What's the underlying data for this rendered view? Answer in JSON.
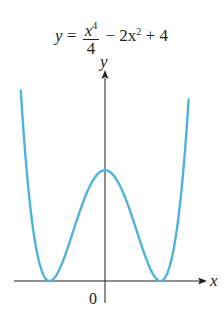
{
  "chart_data": {
    "type": "line",
    "title_parts": {
      "lhs": "y",
      "eq": "=",
      "num_base": "x",
      "num_exp": "4",
      "den": "4",
      "rest": "− 2x",
      "rest_exp": "2",
      "tail": "+ 4"
    },
    "xlabel": "x",
    "ylabel": "y",
    "origin_label": "0",
    "series": [
      {
        "name": "y = x^4/4 - 2x^2 + 4",
        "color": "#4fb3dc",
        "x": [
          -3,
          -2.5,
          -2,
          -1.5,
          -1,
          -0.5,
          0,
          0.5,
          1,
          1.5,
          2,
          2.5,
          3
        ],
        "values": [
          6.25,
          1.27,
          0,
          0.77,
          2.25,
          3.52,
          4,
          3.52,
          2.25,
          0.77,
          0,
          1.27,
          6.25
        ]
      }
    ],
    "xlim": [
      -3.7,
      4.2
    ],
    "ylim": [
      -0.8,
      6.6
    ],
    "grid": false,
    "legend": "none",
    "key_points": {
      "local_max": [
        0,
        4
      ],
      "minima": [
        [
          -2,
          0
        ],
        [
          2,
          0
        ]
      ]
    }
  },
  "colors": {
    "curve": "#4fb3dc",
    "axis": "#231f20"
  }
}
